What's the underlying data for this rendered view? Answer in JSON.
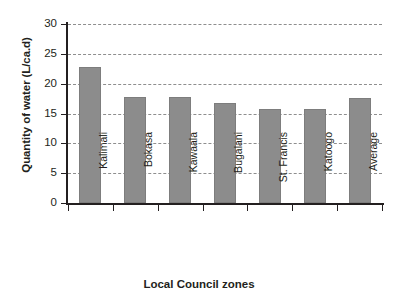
{
  "chart_data": {
    "type": "bar",
    "title": "",
    "xlabel": "Local Council  zones",
    "ylabel": "Quantity of water (L/ca.d)",
    "categories": [
      "Kalimali",
      "Bokasa",
      "Kawaala",
      "Bugalani",
      "St. Francis",
      "Katoogo",
      "Average"
    ],
    "values": [
      22.8,
      17.8,
      17.8,
      16.7,
      15.7,
      15.7,
      17.6
    ],
    "ylim": [
      0,
      30
    ],
    "yticks": [
      0,
      5,
      10,
      15,
      20,
      25,
      30
    ],
    "ytick_labels": [
      "0",
      "5",
      "10",
      "15",
      "20",
      "25",
      "30"
    ],
    "grid": "horizontal-dashed",
    "legend": "none",
    "bar_color": "#8c8c8c",
    "axis_color": "#231f20",
    "gridline_color": "#8e8e8e",
    "background": "#ffffff"
  }
}
